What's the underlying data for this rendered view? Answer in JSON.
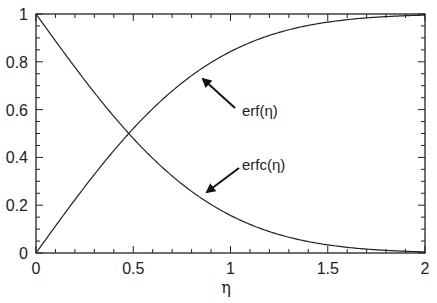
{
  "chart_data": {
    "type": "line",
    "title": "",
    "xlabel": "η",
    "ylabel": "",
    "xlim": [
      0,
      2
    ],
    "ylim": [
      0,
      1
    ],
    "grid": false,
    "legend": "none (curves labeled with arrow annotations)",
    "x_ticks": [
      0,
      0.5,
      1,
      1.5,
      2
    ],
    "x_tick_labels": [
      "0",
      "0.5",
      "1",
      "1.5",
      "2"
    ],
    "x_minor_step": 0.1,
    "y_ticks": [
      0,
      0.2,
      0.4,
      0.6,
      0.8,
      1
    ],
    "y_tick_labels": [
      "0",
      "0.2",
      "0.4",
      "0.6",
      "0.8",
      "1"
    ],
    "y_minor_step": 0.05,
    "x": [
      0,
      0.1,
      0.2,
      0.3,
      0.4,
      0.5,
      0.6,
      0.7,
      0.8,
      0.9,
      1.0,
      1.1,
      1.2,
      1.3,
      1.4,
      1.5,
      1.6,
      1.7,
      1.8,
      1.9,
      2.0
    ],
    "series": [
      {
        "name": "erf(η)",
        "values": [
          0,
          0.112,
          0.223,
          0.329,
          0.428,
          0.52,
          0.604,
          0.678,
          0.742,
          0.797,
          0.843,
          0.88,
          0.91,
          0.934,
          0.952,
          0.966,
          0.976,
          0.984,
          0.989,
          0.993,
          0.995
        ]
      },
      {
        "name": "erfc(η)",
        "values": [
          1,
          0.888,
          0.777,
          0.671,
          0.572,
          0.48,
          0.396,
          0.322,
          0.258,
          0.203,
          0.157,
          0.12,
          0.09,
          0.066,
          0.048,
          0.034,
          0.024,
          0.016,
          0.011,
          0.007,
          0.005
        ]
      }
    ],
    "annotations": [
      {
        "text": "erf(η)",
        "arrow_to": [
          0.84,
          0.75
        ],
        "text_at": [
          1.04,
          0.57
        ]
      },
      {
        "text": "erfc(η)",
        "arrow_to": [
          0.85,
          0.25
        ],
        "text_at": [
          1.04,
          0.39
        ]
      }
    ]
  },
  "labels": {
    "xlabel": "η",
    "annotation_erf": "erf(η)",
    "annotation_erfc": "erfc(η)"
  }
}
